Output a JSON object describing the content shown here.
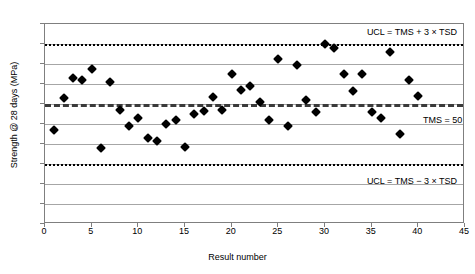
{
  "chart_data": {
    "type": "scatter",
    "title": "",
    "xlabel": "Result number",
    "ylabel": "Strength @ 28 days (MPa)",
    "xlim": [
      0,
      45
    ],
    "ylim": [
      20,
      70
    ],
    "xticks": [
      0,
      5,
      10,
      15,
      20,
      25,
      30,
      35,
      40,
      45
    ],
    "yticks": [
      20,
      25,
      30,
      35,
      40,
      45,
      50,
      55,
      60,
      65,
      70
    ],
    "grid": "horizontal",
    "legend": "none",
    "marker": "diamond",
    "marker_color": "#000000",
    "series": [
      {
        "name": "Strength @ 28 days",
        "x": [
          1,
          2,
          3,
          4,
          5,
          6,
          7,
          8,
          9,
          10,
          11,
          12,
          13,
          14,
          15,
          16,
          17,
          18,
          19,
          20,
          21,
          22,
          23,
          24,
          25,
          26,
          27,
          28,
          29,
          30,
          31,
          32,
          33,
          34,
          35,
          36,
          37,
          38,
          39,
          40
        ],
        "values": [
          43.5,
          51.4,
          56.4,
          56.0,
          58.7,
          39.0,
          55.4,
          48.6,
          44.4,
          46.5,
          41.5,
          40.8,
          45.0,
          46.1,
          39.3,
          47.5,
          48.2,
          51.8,
          48.5,
          57.5,
          53.5,
          54.5,
          50.5,
          46.0,
          61.3,
          44.5,
          59.8,
          51.0,
          47.9,
          65.0,
          64.0,
          57.5,
          53.3,
          57.5,
          48.0,
          46.6,
          63.0,
          42.5,
          56.0,
          52.0
        ]
      }
    ],
    "reference_lines": [
      {
        "name": "ucl-upper",
        "value": 65,
        "style": "dotted",
        "label": "UCL = TMS + 3 × TSD"
      },
      {
        "name": "tms",
        "value": 50,
        "style": "dashed",
        "label": "TMS = 50"
      },
      {
        "name": "ucl-lower",
        "value": 35,
        "style": "dotted",
        "label": "UCL = TMS − 3 × TSD"
      }
    ]
  },
  "annotations": {
    "ucl_upper": "UCL = TMS + 3 × TSD",
    "ucl_lower": "UCL = TMS − 3 × TSD",
    "tms": "TMS = 50"
  },
  "axes": {
    "x_title": "Result number",
    "y_title": "Strength @ 28 days (MPa)"
  }
}
